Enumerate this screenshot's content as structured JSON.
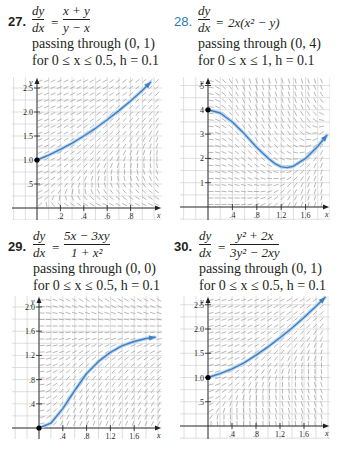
{
  "problems": [
    {
      "number": "27.",
      "dy": "dy",
      "dx": "dx",
      "equals": "=",
      "rhs_num": "x + y",
      "rhs_den": "y − x",
      "rhs_inline": "",
      "line1": "passing through (0, 1)",
      "line2": "for 0 ≤ x ≤ 0.5, h = 0.1"
    },
    {
      "number": "28.",
      "dy": "dy",
      "dx": "dx",
      "equals": "=",
      "rhs_num": "",
      "rhs_den": "",
      "rhs_inline": "2x(x² − y)",
      "line1": "passing through (0, 4)",
      "line2": "for 0 ≤ x ≤ 1, h = 0.1"
    },
    {
      "number": "29.",
      "dy": "dy",
      "dx": "dx",
      "equals": "=",
      "rhs_num": "5x − 3xy",
      "rhs_den": "1 + x²",
      "rhs_inline": "",
      "line1": "passing through (0, 0)",
      "line2": "for 0 ≤ x ≤ 0.5, h = 0.1"
    },
    {
      "number": "30.",
      "dy": "dy",
      "dx": "dx",
      "equals": "=",
      "rhs_num": "y² + 2x",
      "rhs_den": "3y² − 2xy",
      "rhs_inline": "",
      "line1": "passing through (0, 1)",
      "line2": "for 0 ≤ x ≤ 0.5, h = 0.1"
    }
  ],
  "colors": {
    "text": "#231f20",
    "number_highlight": "#2a7ab8",
    "grid": "#c9c9c9",
    "slope_segments": "#9a9a9a",
    "axis": "#231f20",
    "curve": "#3f7fc1",
    "curve_glow": "#b9d6f0",
    "point": "#000000"
  },
  "chart_data": [
    {
      "type": "line",
      "title": "27. dy/dx = (x + y)/(y − x)",
      "xlabel": "x",
      "ylabel": "y",
      "xlim": [
        -0.1,
        1.0
      ],
      "ylim": [
        -0.1,
        2.7
      ],
      "xticks": [
        0.2,
        0.4,
        0.6,
        0.8
      ],
      "xtick_labels": [
        ".2",
        ".4",
        ".6",
        ".8"
      ],
      "yticks": [
        0.5,
        1.0,
        1.5,
        2.0,
        2.5
      ],
      "ytick_labels": [
        ".5",
        "1.0",
        "1.5",
        "2.0",
        "2.5"
      ],
      "grid": true,
      "slope_field": "(x+y)/(y-x)",
      "initial_point": [
        0,
        1
      ],
      "series": [
        {
          "name": "solution",
          "x": [
            0,
            0.1,
            0.2,
            0.3,
            0.4,
            0.5,
            0.6,
            0.7,
            0.8,
            0.9,
            0.97
          ],
          "y": [
            1.0,
            1.1,
            1.22,
            1.35,
            1.5,
            1.66,
            1.84,
            2.03,
            2.23,
            2.45,
            2.62
          ]
        }
      ],
      "ends_with_arrow": true,
      "box": {
        "left": 12,
        "top": 77,
        "width": 150,
        "height": 143,
        "ox": 37,
        "oy": 208,
        "sx": 117,
        "sy": 48
      }
    },
    {
      "type": "line",
      "title": "28. dy/dx = 2x(x² − y)",
      "xlabel": "x",
      "ylabel": "y",
      "xlim": [
        -0.45,
        2.0
      ],
      "ylim": [
        -0.5,
        5.8
      ],
      "xticks": [
        0.4,
        0.8,
        1.2,
        1.6
      ],
      "xtick_labels": [
        ".4",
        ".8",
        "1.2",
        "1.6"
      ],
      "yticks": [
        1,
        2,
        3,
        4,
        5
      ],
      "ytick_labels": [
        "1",
        "2",
        "3",
        "4",
        "5"
      ],
      "grid": true,
      "slope_field": "2x(x^2-y)",
      "initial_point": [
        0,
        4
      ],
      "series": [
        {
          "name": "solution",
          "x": [
            0,
            0.2,
            0.4,
            0.6,
            0.8,
            1.0,
            1.1,
            1.2,
            1.3,
            1.4,
            1.6,
            1.8,
            1.95
          ],
          "y": [
            4.0,
            3.87,
            3.5,
            3.0,
            2.45,
            1.98,
            1.78,
            1.65,
            1.62,
            1.68,
            2.0,
            2.5,
            2.95
          ]
        }
      ],
      "ends_with_arrow": true,
      "box": {
        "left": 180,
        "top": 77,
        "width": 150,
        "height": 143,
        "ox": 208,
        "oy": 207,
        "sx": 61,
        "sy": 24.3
      }
    },
    {
      "type": "line",
      "title": "29. dy/dx = (5x − 3xy)/(1 + x²)",
      "xlabel": "x",
      "ylabel": "y",
      "xlim": [
        -0.45,
        2.0
      ],
      "ylim": [
        -0.2,
        2.1
      ],
      "xticks": [
        0.4,
        0.8,
        1.2,
        1.6
      ],
      "xtick_labels": [
        ".4",
        ".8",
        "1.2",
        "1.6"
      ],
      "yticks": [
        0.4,
        0.8,
        1.2,
        1.6,
        2.0
      ],
      "ytick_labels": [
        ".4",
        ".8",
        "1.2",
        "1.6",
        "2.0"
      ],
      "grid": true,
      "slope_field": "(5x-3xy)/(1+x^2)",
      "initial_point": [
        0,
        0
      ],
      "series": [
        {
          "name": "solution",
          "x": [
            0,
            0.2,
            0.4,
            0.6,
            0.8,
            1.0,
            1.2,
            1.4,
            1.6,
            1.8,
            1.95
          ],
          "y": [
            0,
            0.08,
            0.32,
            0.62,
            0.9,
            1.1,
            1.25,
            1.36,
            1.43,
            1.48,
            1.5
          ]
        }
      ],
      "ends_with_arrow": true,
      "box": {
        "left": 12,
        "top": 296,
        "width": 150,
        "height": 143,
        "ox": 39,
        "oy": 428,
        "sx": 59.5,
        "sy": 60.5
      }
    },
    {
      "type": "line",
      "title": "30. dy/dx = (y² + 2x)/(3y² − 2xy)",
      "xlabel": "x",
      "ylabel": "y",
      "xlim": [
        -0.45,
        2.0
      ],
      "ylim": [
        -0.25,
        2.8
      ],
      "xticks": [
        0.4,
        0.8,
        1.2,
        1.6
      ],
      "xtick_labels": [
        ".4",
        ".8",
        "1.2",
        "1.6"
      ],
      "yticks": [
        0.5,
        1.0,
        1.5,
        2.0,
        2.5
      ],
      "ytick_labels": [
        ".5",
        "1.0",
        "1.5",
        "2.0",
        "2.5"
      ],
      "grid": true,
      "slope_field": "(y^2+2x)/(3y^2-2xy)",
      "initial_point": [
        0,
        1
      ],
      "series": [
        {
          "name": "solution",
          "x": [
            0,
            0.2,
            0.4,
            0.6,
            0.8,
            1.0,
            1.2,
            1.4,
            1.6,
            1.8,
            1.95
          ],
          "y": [
            1.0,
            1.08,
            1.18,
            1.3,
            1.46,
            1.63,
            1.82,
            2.02,
            2.24,
            2.47,
            2.65
          ]
        }
      ],
      "ends_with_arrow": true,
      "box": {
        "left": 180,
        "top": 296,
        "width": 150,
        "height": 143,
        "ox": 208,
        "oy": 426,
        "sx": 60,
        "sy": 48.5
      }
    }
  ]
}
